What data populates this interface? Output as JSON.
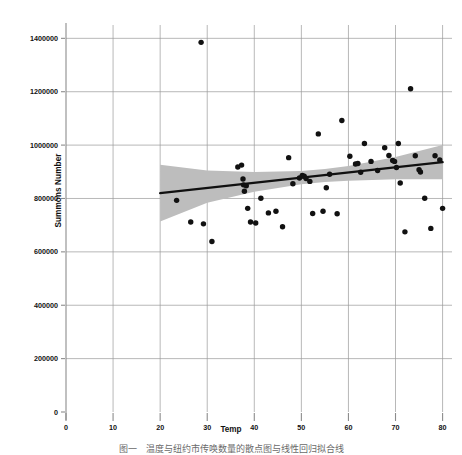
{
  "chart_data": {
    "type": "scatter",
    "title": "",
    "xlabel": "Temp",
    "ylabel": "Summons Number",
    "xlim": [
      0,
      82
    ],
    "ylim": [
      0,
      1450000
    ],
    "grid": true,
    "legend": false,
    "xticks": [
      0,
      10,
      20,
      30,
      40,
      50,
      60,
      70,
      80
    ],
    "xticklabels": [
      "0",
      "10",
      "20",
      "30",
      "40",
      "50",
      "60",
      "70",
      "80"
    ],
    "yticks": [
      0,
      200000,
      400000,
      600000,
      800000,
      1000000,
      1200000,
      1400000
    ],
    "yticklabels": [
      "0",
      "200000",
      "400000",
      "600000",
      "800000",
      "1000000",
      "1200000",
      "1400000"
    ],
    "marker": {
      "shape": "circle",
      "color": "#111111",
      "size": 4.2
    },
    "points": [
      {
        "x": 23.5,
        "y": 793000
      },
      {
        "x": 28.7,
        "y": 1385000
      },
      {
        "x": 26.5,
        "y": 712000
      },
      {
        "x": 29.2,
        "y": 705000
      },
      {
        "x": 31.0,
        "y": 639000
      },
      {
        "x": 36.5,
        "y": 918000
      },
      {
        "x": 37.3,
        "y": 925000
      },
      {
        "x": 37.6,
        "y": 873000
      },
      {
        "x": 37.7,
        "y": 851000
      },
      {
        "x": 37.9,
        "y": 827000
      },
      {
        "x": 38.3,
        "y": 848000
      },
      {
        "x": 38.6,
        "y": 763000
      },
      {
        "x": 39.2,
        "y": 712000
      },
      {
        "x": 40.3,
        "y": 708000
      },
      {
        "x": 41.4,
        "y": 801000
      },
      {
        "x": 43.0,
        "y": 746000
      },
      {
        "x": 44.6,
        "y": 752000
      },
      {
        "x": 46.0,
        "y": 694000
      },
      {
        "x": 47.3,
        "y": 953000
      },
      {
        "x": 48.2,
        "y": 855000
      },
      {
        "x": 49.6,
        "y": 877000
      },
      {
        "x": 50.2,
        "y": 886000
      },
      {
        "x": 50.6,
        "y": 883000
      },
      {
        "x": 51.0,
        "y": 875000
      },
      {
        "x": 51.8,
        "y": 864000
      },
      {
        "x": 52.4,
        "y": 744000
      },
      {
        "x": 53.6,
        "y": 1042000
      },
      {
        "x": 54.6,
        "y": 752000
      },
      {
        "x": 55.3,
        "y": 840000
      },
      {
        "x": 56.0,
        "y": 891000
      },
      {
        "x": 57.6,
        "y": 743000
      },
      {
        "x": 58.6,
        "y": 1092000
      },
      {
        "x": 60.3,
        "y": 958000
      },
      {
        "x": 61.5,
        "y": 929000
      },
      {
        "x": 62.0,
        "y": 931000
      },
      {
        "x": 62.6,
        "y": 898000
      },
      {
        "x": 63.4,
        "y": 1006000
      },
      {
        "x": 64.8,
        "y": 939000
      },
      {
        "x": 66.2,
        "y": 905000
      },
      {
        "x": 67.7,
        "y": 990000
      },
      {
        "x": 68.6,
        "y": 961000
      },
      {
        "x": 69.4,
        "y": 942000
      },
      {
        "x": 69.8,
        "y": 939000
      },
      {
        "x": 70.2,
        "y": 916000
      },
      {
        "x": 70.6,
        "y": 1006000
      },
      {
        "x": 71.0,
        "y": 858000
      },
      {
        "x": 72.0,
        "y": 675000
      },
      {
        "x": 73.2,
        "y": 1211000
      },
      {
        "x": 74.2,
        "y": 960000
      },
      {
        "x": 75.0,
        "y": 908000
      },
      {
        "x": 75.3,
        "y": 899000
      },
      {
        "x": 76.2,
        "y": 801000
      },
      {
        "x": 77.5,
        "y": 688000
      },
      {
        "x": 78.4,
        "y": 960000
      },
      {
        "x": 79.4,
        "y": 944000
      },
      {
        "x": 80.0,
        "y": 763000
      }
    ],
    "fit_line": {
      "label": "linear regression",
      "color": "#111111",
      "width": 2.4,
      "x_start": 20.0,
      "x_end": 80.0,
      "y_start": 820000,
      "y_end": 936000
    },
    "confidence_band": {
      "color": "#bdbdbd",
      "opacity": 1,
      "x": [
        20,
        30,
        40,
        50,
        55,
        60,
        70,
        80
      ],
      "upper": [
        926000,
        905000,
        899000,
        903000,
        910000,
        922000,
        955000,
        1000000
      ],
      "lower": [
        714000,
        784000,
        825000,
        853000,
        862000,
        866000,
        872000,
        872000
      ]
    }
  },
  "figure": {
    "caption": "图一　温度与纽约市传唤数量的散点图与线性回归拟合线"
  }
}
